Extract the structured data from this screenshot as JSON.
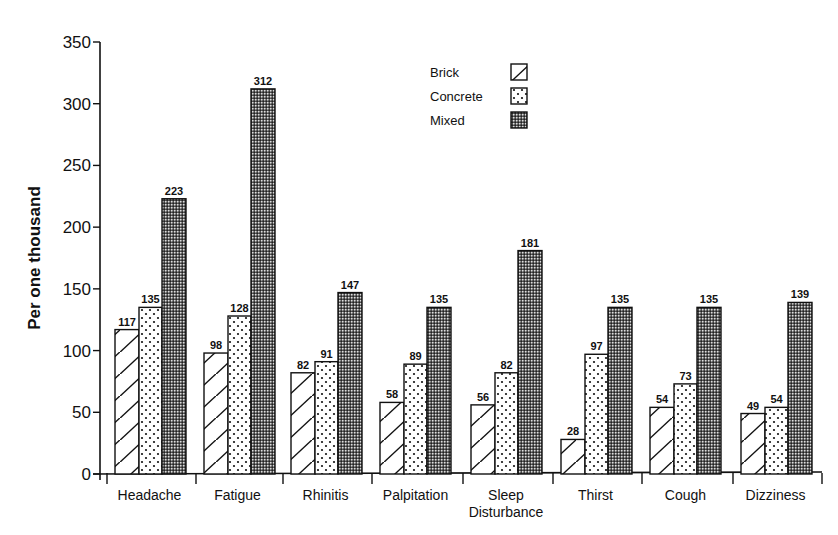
{
  "chart_data": {
    "type": "bar",
    "title": "",
    "xlabel": "",
    "ylabel": "Per one thousand",
    "ylim": [
      0,
      350
    ],
    "yticks": [
      0,
      50,
      100,
      150,
      200,
      250,
      300,
      350
    ],
    "grid": false,
    "legend_position": "top-center-right",
    "categories": [
      "Headache",
      "Fatigue",
      "Rhinitis",
      "Palpitation",
      "Sleep Disturbance",
      "Thirst",
      "Cough",
      "Dizziness"
    ],
    "category_lines": [
      [
        "Headache"
      ],
      [
        "Fatigue"
      ],
      [
        "Rhinitis"
      ],
      [
        "Palpitation"
      ],
      [
        "Sleep",
        "Disturbance"
      ],
      [
        "Thirst"
      ],
      [
        "Cough"
      ],
      [
        "Dizziness"
      ]
    ],
    "series": [
      {
        "name": "Brick",
        "pattern": "diagonal-hatch",
        "values": [
          117,
          98,
          82,
          58,
          56,
          28,
          54,
          49
        ]
      },
      {
        "name": "Concrete",
        "pattern": "sparse-dots",
        "values": [
          135,
          128,
          91,
          89,
          82,
          97,
          73,
          54
        ]
      },
      {
        "name": "Mixed",
        "pattern": "dense-checker",
        "values": [
          223,
          312,
          147,
          135,
          181,
          135,
          135,
          139
        ]
      }
    ],
    "data_labels": true
  },
  "legend": {
    "items": [
      {
        "label": "Brick",
        "icon": "diagonal-hatch-swatch"
      },
      {
        "label": "Concrete",
        "icon": "dotted-swatch"
      },
      {
        "label": "Mixed",
        "icon": "dense-checker-swatch"
      }
    ]
  },
  "colors": {
    "ink": "#111111",
    "background": "#ffffff"
  }
}
